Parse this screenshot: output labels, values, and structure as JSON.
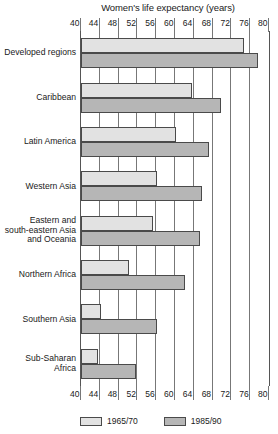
{
  "chart_data": {
    "type": "bar",
    "orientation": "horizontal",
    "title": "Women's life expectancy (years)",
    "xlabel": "",
    "ylabel": "",
    "xlim": [
      40,
      80
    ],
    "xticks": [
      40,
      44,
      48,
      52,
      56,
      60,
      64,
      68,
      72,
      76,
      80
    ],
    "grid": true,
    "axis_top": true,
    "axis_bottom": true,
    "legend_position": "bottom",
    "categories": [
      "Developed regions",
      "Caribbean",
      "Latin America",
      "Western Asia",
      "Eastern and\nsouth-eastern Asia\nand Oceania",
      "Northern Africa",
      "Southern Asia",
      "Sub-Saharan\nAfrica"
    ],
    "series": [
      {
        "name": "1965/70",
        "color": "#e2e2e2",
        "values": [
          74.5,
          63.5,
          60.0,
          56.0,
          55.0,
          50.0,
          44.0,
          43.5
        ]
      },
      {
        "name": "1985/90",
        "color": "#b6b6b6",
        "values": [
          77.5,
          69.5,
          67.0,
          65.5,
          65.0,
          62.0,
          56.0,
          51.5
        ]
      }
    ]
  },
  "legend": {
    "items": [
      {
        "label": "1965/70"
      },
      {
        "label": "1985/90"
      }
    ]
  },
  "colors": {
    "early_bar": "#e2e2e2",
    "late_bar": "#b6b6b6",
    "axis": "#555555",
    "grid": "#777777",
    "text": "#1a1a1a"
  }
}
